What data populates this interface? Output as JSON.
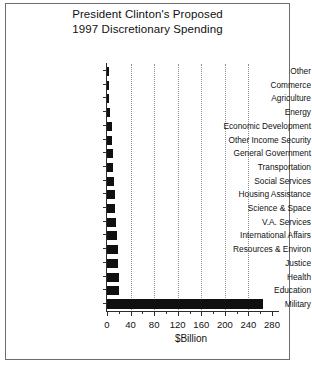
{
  "chart_data": {
    "type": "bar",
    "orientation": "horizontal",
    "title": "President Clinton's Proposed 1997 Discretionary Spending",
    "title_lines": [
      "President Clinton's Proposed",
      "1997 Discretionary Spending"
    ],
    "xlabel": "$Billion",
    "ylabel": "",
    "xlim": [
      0,
      280
    ],
    "xticks": [
      0,
      40,
      80,
      120,
      160,
      200,
      240,
      280
    ],
    "xtick_labels": [
      "0",
      "40",
      "80",
      "120",
      "160",
      "200",
      "240",
      "280"
    ],
    "minor_tick_step": 20,
    "grid": true,
    "gridlines_at": [
      40,
      80,
      120,
      160,
      200,
      240
    ],
    "legend": null,
    "bar_color": "#101010",
    "categories": [
      "Other",
      "Commerce",
      "Agriculture",
      "Energy",
      "Economic Development",
      "Other Income Security",
      "General Government",
      "Transportation",
      "Social Services",
      "Housing Assistance",
      "Science & Space",
      "V.A. Services",
      "International Affairs",
      "Resources & Environ",
      "Justice",
      "Health",
      "Education",
      "Military"
    ],
    "values": [
      3,
      3,
      4,
      5,
      8,
      9,
      10,
      11,
      12,
      14,
      14,
      16,
      17,
      18,
      19,
      20,
      21,
      265
    ]
  }
}
